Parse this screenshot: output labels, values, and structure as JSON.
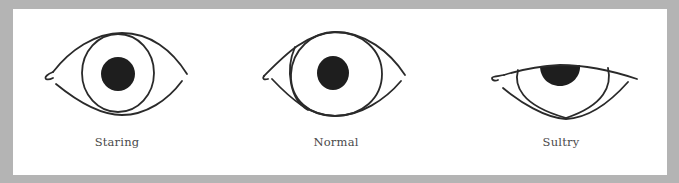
{
  "figure": {
    "background_color": "#b4b4b4",
    "panel_color": "#ffffff",
    "stroke_color": "#2a2a2a",
    "pupil_color": "#1e1e1e",
    "eyes": [
      {
        "id": "staring",
        "label": "Staring"
      },
      {
        "id": "normal",
        "label": "Normal"
      },
      {
        "id": "sultry",
        "label": "Sultry"
      }
    ]
  }
}
